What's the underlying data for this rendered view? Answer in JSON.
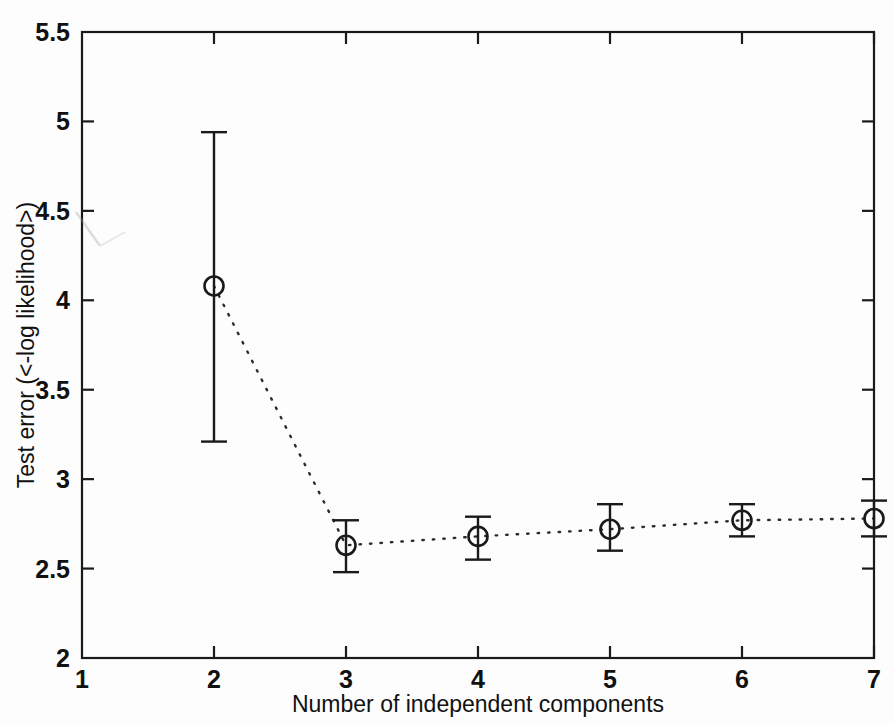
{
  "figure": {
    "background_color": "#fdfdfd",
    "ink_color": "#1a1a1a"
  },
  "chart_data": {
    "type": "line",
    "title": "",
    "xlabel": "Number of independent components",
    "ylabel": "Test error (<-log likelihood>)",
    "xlim": [
      1,
      7
    ],
    "ylim": [
      2,
      5.5
    ],
    "xticks": [
      1,
      2,
      3,
      4,
      5,
      6,
      7
    ],
    "xticklabels": [
      "1",
      "2",
      "3",
      "4",
      "5",
      "6",
      "7"
    ],
    "yticks": [
      2,
      2.5,
      3,
      3.5,
      4,
      4.5,
      5,
      5.5
    ],
    "yticklabels": [
      "2",
      "2.5",
      "3",
      "3.5",
      "4",
      "4.5",
      "5",
      "5.5"
    ],
    "grid": false,
    "legend": null,
    "linestyle": "dotted",
    "marker": "circle-open",
    "errorbar": true,
    "x": [
      2,
      3,
      4,
      5,
      6,
      7
    ],
    "values": [
      4.08,
      2.63,
      2.68,
      2.72,
      2.77,
      2.78
    ],
    "err_low": [
      3.21,
      2.48,
      2.55,
      2.6,
      2.68,
      2.68
    ],
    "err_high": [
      4.94,
      2.77,
      2.79,
      2.86,
      2.86,
      2.88
    ],
    "series": [
      {
        "name": "Test error",
        "points": [
          {
            "x": 2,
            "y": 4.08,
            "low": 3.21,
            "high": 4.94
          },
          {
            "x": 3,
            "y": 2.63,
            "low": 2.48,
            "high": 2.77
          },
          {
            "x": 4,
            "y": 2.68,
            "low": 2.55,
            "high": 2.79
          },
          {
            "x": 5,
            "y": 2.72,
            "low": 2.6,
            "high": 2.86
          },
          {
            "x": 6,
            "y": 2.77,
            "low": 2.68,
            "high": 2.86
          },
          {
            "x": 7,
            "y": 2.78,
            "low": 2.68,
            "high": 2.88
          }
        ]
      }
    ]
  }
}
